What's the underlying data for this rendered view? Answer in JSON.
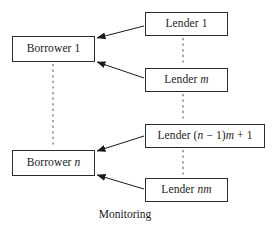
{
  "diagram": {
    "caption": "Monitoring",
    "borrowers": [
      {
        "id": "borrower-1",
        "label": "Borrower 1"
      },
      {
        "id": "borrower-n",
        "label": "Borrower n"
      }
    ],
    "lenders": [
      {
        "id": "lender-1",
        "label": "Lender 1"
      },
      {
        "id": "lender-m",
        "label": "Lender m"
      },
      {
        "id": "lender-nm1",
        "label": "Lender (n − 1)m + 1"
      },
      {
        "id": "lender-nm",
        "label": "Lender nm"
      }
    ],
    "edges": [
      {
        "from": "lender-1",
        "to": "borrower-1",
        "style": "solid-arrow"
      },
      {
        "from": "lender-m",
        "to": "borrower-1",
        "style": "solid-arrow"
      },
      {
        "from": "lender-nm1",
        "to": "borrower-n",
        "style": "solid-arrow"
      },
      {
        "from": "lender-nm",
        "to": "borrower-n",
        "style": "solid-arrow"
      }
    ],
    "ellipses": [
      {
        "id": "ellipsis-borrowers",
        "orientation": "vertical",
        "between": "borrower-1 → borrower-n"
      },
      {
        "id": "ellipsis-lenders-top",
        "orientation": "vertical",
        "between": "lender-1 → lender-m"
      },
      {
        "id": "ellipsis-lenders-mid",
        "orientation": "vertical",
        "between": "lender-m → lender-nm1"
      },
      {
        "id": "ellipsis-lenders-bot",
        "orientation": "vertical",
        "between": "lender-nm1 → lender-nm"
      }
    ],
    "colors": {
      "stroke": "#2b2b2b",
      "dash": "#6b6b6b",
      "background": "#ffffff",
      "text": "#1a1a1a"
    }
  }
}
